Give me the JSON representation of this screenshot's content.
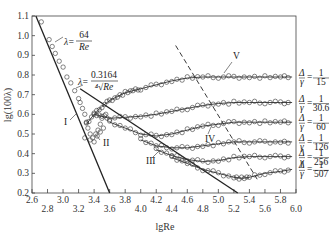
{
  "chart_data": {
    "type": "line",
    "title": "",
    "xlabel": "lgRe",
    "ylabel": "lg(100λ)",
    "xlim": [
      2.6,
      6.0
    ],
    "ylim": [
      0.2,
      1.1
    ],
    "grid": false,
    "x_ticks_upper": [
      "2.6",
      "3.0",
      "3.4",
      "3.8",
      "4.2",
      "4.6",
      "5.0",
      "5.4",
      "5.8"
    ],
    "x_ticks_lower": [
      "2.8",
      "3.2",
      "3.6",
      "4.0",
      "4.4",
      "4.8",
      "5.2",
      "5.6",
      "6.0"
    ],
    "y_ticks": [
      "0.2",
      "0.3",
      "0.4",
      "0.5",
      "0.6",
      "0.7",
      "0.8",
      "0.9",
      "1.0",
      "1.1"
    ],
    "reference_lines": [
      {
        "name": "laminar",
        "formula_lhs": "λ=",
        "formula_num": "64",
        "formula_den": "Re",
        "style": "solid",
        "points": [
          [
            2.65,
            1.1
          ],
          [
            3.6,
            0.2
          ]
        ]
      },
      {
        "name": "blasius",
        "formula_lhs": "λ=",
        "formula_num": "0.3164",
        "formula_den": "⁴√Re",
        "style": "solid",
        "points": [
          [
            3.22,
            0.73
          ],
          [
            5.25,
            0.2
          ]
        ]
      },
      {
        "name": "rough-boundary",
        "style": "dashed",
        "points": [
          [
            4.45,
            0.95
          ],
          [
            5.5,
            0.27
          ]
        ]
      }
    ],
    "regions": [
      "I",
      "II",
      "III",
      "IV",
      "V"
    ],
    "series": [
      {
        "name": "Δ/r = 1/15",
        "label_num": "1",
        "label_den": "15",
        "x": [
          3.3,
          3.4,
          3.5,
          3.6,
          3.7,
          3.8,
          3.9,
          4.0,
          4.2,
          4.4,
          4.6,
          4.8,
          5.0,
          5.2,
          5.4,
          5.6,
          5.8,
          5.95
        ],
        "y": [
          0.55,
          0.6,
          0.64,
          0.67,
          0.69,
          0.71,
          0.72,
          0.73,
          0.75,
          0.77,
          0.785,
          0.79,
          0.79,
          0.79,
          0.79,
          0.79,
          0.79,
          0.79
        ]
      },
      {
        "name": "Δ/r = 1/30.6",
        "label_num": "1",
        "label_den": "30.6",
        "x": [
          3.4,
          3.5,
          3.6,
          3.8,
          4.0,
          4.2,
          4.4,
          4.6,
          4.8,
          5.0,
          5.2,
          5.4,
          5.6,
          5.8,
          5.95
        ],
        "y": [
          0.6,
          0.59,
          0.58,
          0.585,
          0.59,
          0.6,
          0.615,
          0.63,
          0.645,
          0.655,
          0.66,
          0.66,
          0.66,
          0.66,
          0.66
        ]
      },
      {
        "name": "Δ/r = 1/60",
        "label_num": "1",
        "label_den": "60",
        "x": [
          3.6,
          3.8,
          4.0,
          4.2,
          4.4,
          4.6,
          4.8,
          5.0,
          5.2,
          5.4,
          5.6,
          5.8,
          5.95
        ],
        "y": [
          0.56,
          0.53,
          0.5,
          0.49,
          0.5,
          0.52,
          0.54,
          0.55,
          0.56,
          0.56,
          0.56,
          0.56,
          0.56
        ]
      },
      {
        "name": "Δ/r = 1/126",
        "label_num": "1",
        "label_den": "126",
        "x": [
          4.0,
          4.2,
          4.4,
          4.6,
          4.8,
          5.0,
          5.2,
          5.4,
          5.6,
          5.8,
          5.95
        ],
        "y": [
          0.47,
          0.44,
          0.43,
          0.43,
          0.44,
          0.45,
          0.46,
          0.46,
          0.46,
          0.46,
          0.46
        ]
      },
      {
        "name": "Δ/r = 1/256",
        "label_num": "1",
        "label_den": "256",
        "x": [
          4.2,
          4.4,
          4.6,
          4.8,
          5.0,
          5.2,
          5.4,
          5.6,
          5.8,
          5.95
        ],
        "y": [
          0.42,
          0.39,
          0.37,
          0.36,
          0.365,
          0.38,
          0.385,
          0.385,
          0.385,
          0.385
        ]
      },
      {
        "name": "Δ/r = 1/507",
        "label_num": "1",
        "label_den": "507",
        "x": [
          4.4,
          4.6,
          4.8,
          5.0,
          5.2,
          5.3,
          5.4,
          5.6,
          5.8,
          5.95
        ],
        "y": [
          0.38,
          0.35,
          0.32,
          0.3,
          0.28,
          0.275,
          0.28,
          0.3,
          0.31,
          0.32
        ]
      }
    ],
    "legend_position": "right-inline"
  }
}
